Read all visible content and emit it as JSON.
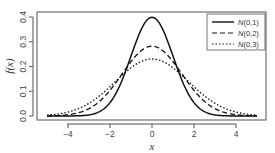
{
  "chart_data": {
    "type": "line",
    "title": "",
    "xlabel": "x",
    "ylabel": "f(x)",
    "xlim": [
      -5,
      5
    ],
    "ylim": [
      0,
      0.4
    ],
    "x_ticks": [
      "-4",
      "-2",
      "0",
      "2",
      "4"
    ],
    "y_ticks": [
      "0.0",
      "0.1",
      "0.2",
      "0.3",
      "0.4"
    ],
    "grid": false,
    "legend_position": "top-right",
    "series": [
      {
        "name": "N(0,1)",
        "line_style": "solid",
        "mean": 0,
        "variance": 1,
        "peak": 0.399
      },
      {
        "name": "N(0,2)",
        "line_style": "dashed",
        "mean": 0,
        "variance": 2,
        "peak": 0.282
      },
      {
        "name": "N(0,3)",
        "line_style": "dotted",
        "mean": 0,
        "variance": 3,
        "peak": 0.23
      }
    ],
    "x_range_plotted": [
      -5,
      5
    ]
  },
  "legend": {
    "items": [
      {
        "label_prefix": "N",
        "label_suffix": "(0,1)",
        "style": "solid"
      },
      {
        "label_prefix": "N",
        "label_suffix": "(0,2)",
        "style": "dashed"
      },
      {
        "label_prefix": "N",
        "label_suffix": "(0,3)",
        "style": "dotted"
      }
    ]
  },
  "colors": {
    "line": "#111111",
    "axis": "#555555",
    "text": "#333333"
  }
}
